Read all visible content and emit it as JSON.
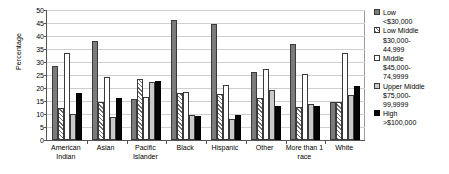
{
  "chart_data": {
    "type": "bar",
    "title": "",
    "xlabel": "",
    "ylabel": "Percentage",
    "ylim": [
      0,
      50
    ],
    "ytick_step": 5,
    "yticks": [
      50,
      45,
      40,
      35,
      30,
      25,
      20,
      15,
      10,
      5,
      0
    ],
    "grid": true,
    "legend_position": "right",
    "categories": [
      "American\nIndian",
      "Asian",
      "Pacific\nIslander",
      "Black",
      "Hispanic",
      "Other",
      "More than 1\nrace",
      "White"
    ],
    "series": [
      {
        "name": "Low",
        "range": "<$30,000",
        "swatch": "solid-gray",
        "color": "#7b7b7b",
        "values": [
          28.5,
          38.0,
          15.8,
          46.0,
          44.5,
          26.0,
          37.0,
          14.8
        ]
      },
      {
        "name": "Low Middle",
        "range": "$30,000-\n44,999",
        "swatch": "diagonal-hatch",
        "color": "#6d6d6d",
        "values": [
          12.2,
          14.5,
          23.5,
          18.2,
          17.8,
          16.0,
          12.8,
          14.8
        ]
      },
      {
        "name": "Middle",
        "range": "$45,000-\n74,9999",
        "swatch": "white",
        "color": "#ffffff",
        "values": [
          33.3,
          24.2,
          16.5,
          18.5,
          21.3,
          27.2,
          25.3,
          33.3
        ]
      },
      {
        "name": "Upper Middle",
        "range": "$75,000-\n99,9999",
        "swatch": "light-gray",
        "color": "#cacaca",
        "values": [
          9.9,
          8.8,
          22.5,
          9.6,
          7.9,
          19.3,
          13.8,
          17.5
        ]
      },
      {
        "name": "High",
        "range": ">$100,000",
        "swatch": "black",
        "color": "#050505",
        "values": [
          17.9,
          16.1,
          22.7,
          9.4,
          9.5,
          12.9,
          12.9,
          20.7
        ]
      }
    ]
  }
}
